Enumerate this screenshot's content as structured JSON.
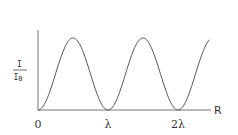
{
  "chart_data": {
    "type": "line",
    "title": "",
    "xlabel": "R",
    "ylabel": "I/I0",
    "ylabel_numerator": "I",
    "ylabel_denominator": "I0",
    "x_tick_labels": [
      "0",
      "λ",
      "2λ"
    ],
    "x_tick_values_in_lambda": [
      0,
      1,
      2
    ],
    "xlim_in_lambda": [
      0,
      2.45
    ],
    "ylim": [
      0,
      1
    ],
    "grid": false,
    "legend": null,
    "series": [
      {
        "name": "I/I0",
        "function": "sin^2(pi*R/lambda)",
        "x_in_lambda": [
          0,
          0.25,
          0.5,
          0.75,
          1.0,
          1.25,
          1.5,
          1.75,
          2.0,
          2.25,
          2.45
        ],
        "values": [
          0,
          0.5,
          1.0,
          0.5,
          0,
          0.5,
          1.0,
          0.5,
          0,
          0.5,
          0.9
        ]
      }
    ],
    "color": "#555555"
  }
}
